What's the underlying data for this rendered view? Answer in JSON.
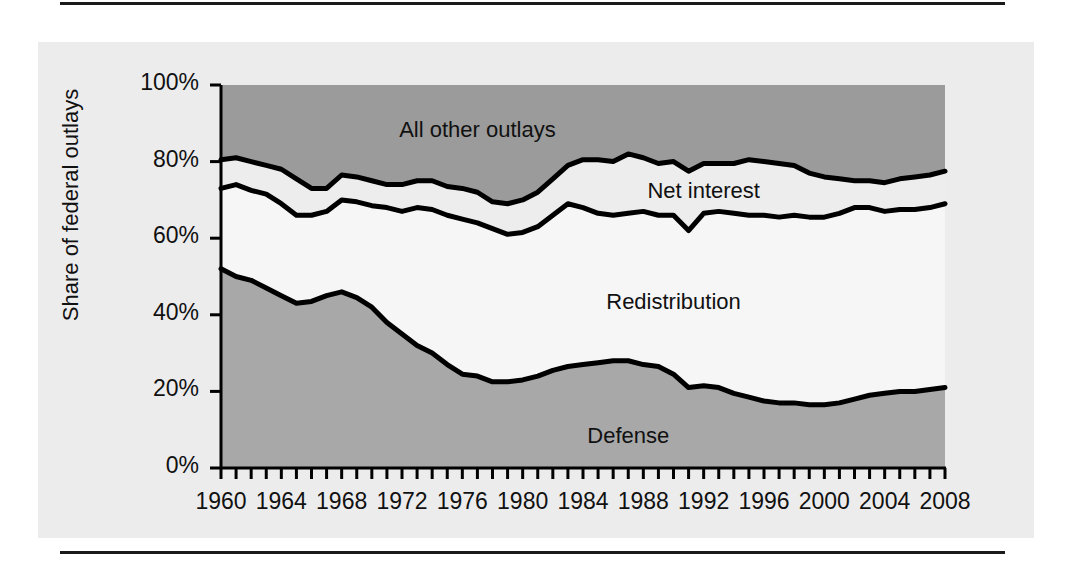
{
  "chart_data": {
    "type": "area",
    "title": "",
    "subtitle": "",
    "xlabel": "",
    "ylabel": "Share of federal outlays",
    "stacked": true,
    "grid": false,
    "legend_position": "inline-annotations",
    "xlim": [
      1960,
      2008
    ],
    "ylim": [
      0,
      100
    ],
    "ytick_labels": [
      "0%",
      "20%",
      "40%",
      "60%",
      "80%",
      "100%"
    ],
    "ytick_values": [
      0,
      20,
      40,
      60,
      80,
      100
    ],
    "xtick_labels": [
      "1960",
      "1964",
      "1968",
      "1972",
      "1976",
      "1980",
      "1984",
      "1988",
      "1992",
      "1996",
      "2000",
      "2004",
      "2008"
    ],
    "xtick_values": [
      1960,
      1964,
      1968,
      1972,
      1976,
      1980,
      1984,
      1988,
      1992,
      1996,
      2000,
      2004,
      2008
    ],
    "minor_tick_interval": 1,
    "x": [
      1960,
      1961,
      1962,
      1963,
      1964,
      1965,
      1966,
      1967,
      1968,
      1969,
      1970,
      1971,
      1972,
      1973,
      1974,
      1975,
      1976,
      1977,
      1978,
      1979,
      1980,
      1981,
      1982,
      1983,
      1984,
      1985,
      1986,
      1987,
      1988,
      1989,
      1990,
      1991,
      1992,
      1993,
      1994,
      1995,
      1996,
      1997,
      1998,
      1999,
      2000,
      2001,
      2002,
      2003,
      2004,
      2005,
      2006,
      2007,
      2008
    ],
    "series": [
      {
        "name": "Defense",
        "label": "Defense",
        "color": "#a8a8a8",
        "cumulative_top": [
          52,
          50,
          49,
          47,
          45,
          43,
          43.5,
          45,
          46,
          44.5,
          42,
          38,
          35,
          32,
          30,
          27,
          24.5,
          24,
          22.5,
          22.5,
          23,
          24,
          25.5,
          26.5,
          27,
          27.5,
          28,
          28,
          27,
          26.5,
          24.5,
          21,
          21.5,
          21,
          19.5,
          18.5,
          17.5,
          17,
          17,
          16.5,
          16.5,
          17,
          18,
          19,
          19.5,
          20,
          20,
          20.5,
          21
        ]
      },
      {
        "name": "Redistribution",
        "label": "Redistribution",
        "color": "#f6f6f6",
        "cumulative_top": [
          73,
          74,
          72.5,
          71.5,
          69,
          66,
          66,
          67,
          70,
          69.5,
          68.5,
          68,
          67,
          68,
          67.5,
          66,
          65,
          64,
          62.5,
          61,
          61.5,
          63,
          66,
          69,
          68,
          66.5,
          66,
          66.5,
          67,
          66,
          66,
          62,
          66.5,
          67,
          66.5,
          66,
          66,
          65.5,
          66,
          65.5,
          65.5,
          66.5,
          68,
          68,
          67,
          67.5,
          67.5,
          68,
          69
        ]
      },
      {
        "name": "Net interest",
        "label": "Net interest",
        "color": "#ededed",
        "cumulative_top": [
          80.5,
          81,
          80,
          79,
          78,
          75.5,
          73,
          73,
          76.5,
          76,
          75,
          74,
          74,
          75,
          75,
          73.5,
          73,
          72,
          69.5,
          69,
          70,
          72,
          75.5,
          79,
          80.5,
          80.5,
          80,
          82,
          81,
          79.5,
          80,
          77.5,
          79.5,
          79.5,
          79.5,
          80.5,
          80,
          79.5,
          79,
          77,
          76,
          75.5,
          75,
          75,
          74.5,
          75.5,
          76,
          76.5,
          77.5
        ]
      },
      {
        "name": "All other outlays",
        "label": "All other outlays",
        "color": "#9b9b9b",
        "cumulative_top": [
          100,
          100,
          100,
          100,
          100,
          100,
          100,
          100,
          100,
          100,
          100,
          100,
          100,
          100,
          100,
          100,
          100,
          100,
          100,
          100,
          100,
          100,
          100,
          100,
          100,
          100,
          100,
          100,
          100,
          100,
          100,
          100,
          100,
          100,
          100,
          100,
          100,
          100,
          100,
          100,
          100,
          100,
          100,
          100,
          100,
          100,
          100,
          100,
          100
        ]
      }
    ],
    "annotations": [
      {
        "text": "All other outlays",
        "x": 1977,
        "y": 88
      },
      {
        "text": "Net interest",
        "x": 1992,
        "y": 72
      },
      {
        "text": "Redistribution",
        "x": 1990,
        "y": 43
      },
      {
        "text": "Defense",
        "x": 1987,
        "y": 8
      }
    ],
    "colors": {
      "panel_background": "#ececed",
      "plot_line": "#000000",
      "axis": "#000000",
      "defense_fill": "#a8a8a8",
      "redistribution_fill": "#f6f6f6",
      "net_interest_fill": "#ededed",
      "all_other_fill": "#9b9b9b"
    }
  }
}
